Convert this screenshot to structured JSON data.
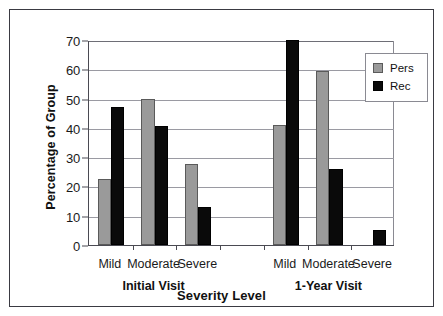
{
  "chart_data": {
    "type": "bar",
    "title": "",
    "xlabel": "Severity Level",
    "ylabel": "Percentage of Group",
    "ylim": [
      0,
      70
    ],
    "ytick_values": [
      0,
      10,
      20,
      30,
      40,
      50,
      60,
      70
    ],
    "ytick_labels": [
      "0",
      "10",
      "20",
      "30",
      "40",
      "50",
      "60",
      "70"
    ],
    "grid": "horizontal",
    "legend_position": "top-right",
    "categories": [
      "Mild",
      "Moderate",
      "Severe",
      "Mild",
      "Moderate",
      "Severe"
    ],
    "groups": [
      {
        "label": "Initial Visit",
        "categories": [
          "Mild",
          "Moderate",
          "Severe"
        ]
      },
      {
        "label": "1-Year Visit",
        "categories": [
          "Mild",
          "Moderate",
          "Severe"
        ]
      }
    ],
    "series": [
      {
        "name": "Pers",
        "color": "#9a9a9a",
        "values": [
          22.5,
          50,
          27.5,
          41,
          59.5,
          0
        ]
      },
      {
        "name": "Rec",
        "color": "#0a0a0a",
        "values": [
          47,
          40.5,
          13,
          70,
          26,
          5
        ]
      }
    ]
  },
  "legend": {
    "entries": [
      {
        "label": "Pers",
        "swatch": "pers"
      },
      {
        "label": "Rec",
        "swatch": "rec"
      }
    ]
  },
  "axis": {
    "y_title": "Percentage of Group",
    "x_title": "Severity Level"
  }
}
